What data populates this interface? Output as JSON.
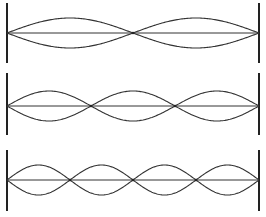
{
  "diagram": {
    "title": "",
    "stroke_color": "#333333",
    "wall_color": "#222222",
    "panels": [
      {
        "loops": 2,
        "center_y": 33,
        "wall_top": 3,
        "wall_bottom": 63,
        "amplitude": 15
      },
      {
        "loops": 3,
        "center_y": 106,
        "wall_top": 73,
        "wall_bottom": 135,
        "amplitude": 15
      },
      {
        "loops": 4,
        "center_y": 180,
        "wall_top": 150,
        "wall_bottom": 211,
        "amplitude": 15
      }
    ],
    "left_x": 7,
    "right_x": 259
  }
}
